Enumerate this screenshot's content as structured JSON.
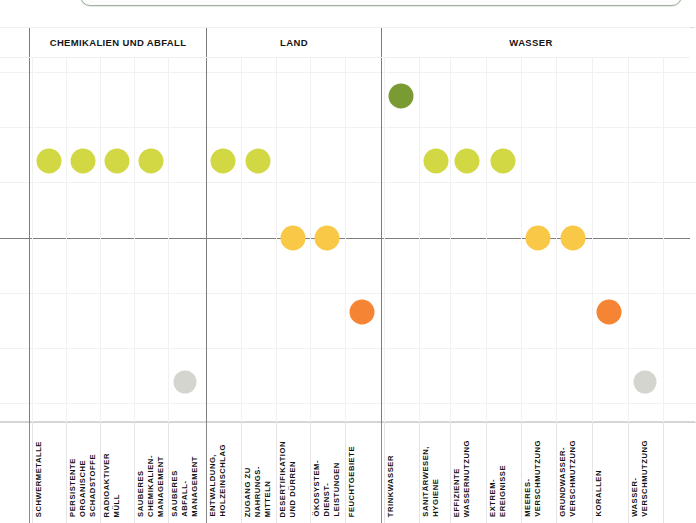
{
  "figure": {
    "title": "",
    "top_panel_edge": "rounded-panel-edge"
  },
  "groups": [
    {
      "id": "chemikalien",
      "label": "CHEMIKALIEN UND ABFALL",
      "x": 29,
      "width": 178
    },
    {
      "id": "land",
      "label": "LAND",
      "x": 207,
      "width": 174
    },
    {
      "id": "wasser",
      "label": "WASSER",
      "x": 381,
      "width": 300
    }
  ],
  "colors": {
    "dark_green": "#7a9b33",
    "yellow_green": "#d2d844",
    "yellow": "#f9c846",
    "orange": "#f58535",
    "grey": "#d4d5cf",
    "axis": "#7d7d7d",
    "grid": "#ececec",
    "panel_edge": "#9fb0a0"
  },
  "axis": {
    "zero_line_y": 211,
    "grid_rows_y": [
      45,
      100,
      155,
      211,
      266,
      321,
      376
    ],
    "plot_top": 30,
    "plot_bottom": 395
  },
  "columns": [
    {
      "id": "schwermetalle",
      "group": "chemikalien",
      "label": "SCHWERMETALLE",
      "x": 49,
      "dot": {
        "y": 134,
        "color": "yellow_green",
        "r": 12.5
      }
    },
    {
      "id": "persistente-organische",
      "group": "chemikalien",
      "label": "PERSISTENTE\nORGANISCHE\nSCHADSTOFFE",
      "x": 83,
      "dot": {
        "y": 134,
        "color": "yellow_green",
        "r": 12.5
      }
    },
    {
      "id": "radioaktiver-muell",
      "group": "chemikalien",
      "label": "RADIOAKTIVER\nMÜLL",
      "x": 117,
      "dot": {
        "y": 134,
        "color": "yellow_green",
        "r": 12.5
      }
    },
    {
      "id": "sauberes-chemikalien-management",
      "group": "chemikalien",
      "label": "SAUBERES\nCHEMIKALIEN-\nMANAGEMENT",
      "x": 151,
      "dot": {
        "y": 134,
        "color": "yellow_green",
        "r": 12.5
      }
    },
    {
      "id": "sauberes-abfall-management",
      "group": "chemikalien",
      "label": "SAUBERES\nABFALL-\nMANAGEMENT",
      "x": 185,
      "dot": {
        "y": 355,
        "color": "grey",
        "r": 11.5
      }
    },
    {
      "id": "entwaldung",
      "group": "land",
      "label": "ENTWALDUNG,\nHOLZEINSCHLAG",
      "x": 223,
      "dot": {
        "y": 134,
        "color": "yellow_green",
        "r": 12.5
      }
    },
    {
      "id": "zugang-nahrungsmittel",
      "group": "land",
      "label": "ZUGANG ZU\nNAHRUNGS-\nMITTELN",
      "x": 258,
      "dot": {
        "y": 134,
        "color": "yellow_green",
        "r": 12.5
      }
    },
    {
      "id": "desertifikation",
      "group": "land",
      "label": "DESERTIFIKATION\nUND DÜRREN",
      "x": 293,
      "dot": {
        "y": 211,
        "color": "yellow",
        "r": 12.5
      }
    },
    {
      "id": "oekosystem-dienstleistungen",
      "group": "land",
      "label": "ÖKOSYSTEM-\nDIENST-\nLEISTUNGEN",
      "x": 327,
      "dot": {
        "y": 211,
        "color": "yellow",
        "r": 12.5
      }
    },
    {
      "id": "feuchtgebiete",
      "group": "land",
      "label": "FEUCHTGEBIETE",
      "x": 362,
      "dot": {
        "y": 285,
        "color": "orange",
        "r": 12.5
      }
    },
    {
      "id": "trinkwasser",
      "group": "wasser",
      "label": "TRINKWASSER",
      "x": 401,
      "dot": {
        "y": 69,
        "color": "dark_green",
        "r": 12.5
      }
    },
    {
      "id": "sanitaerwesen-hygiene",
      "group": "wasser",
      "label": "SANITÄRWESEN,\nHYGIENE",
      "x": 436,
      "dot": {
        "y": 134,
        "color": "yellow_green",
        "r": 12.5
      }
    },
    {
      "id": "effiziente-wassernutzung",
      "group": "wasser",
      "label": "EFFIZIENTE\nWASSERNUTZUNG",
      "x": 467,
      "dot": {
        "y": 134,
        "color": "yellow_green",
        "r": 12.5
      }
    },
    {
      "id": "extremereignisse",
      "group": "wasser",
      "label": "EXTREM-\nEREIGNISSE",
      "x": 503,
      "dot": {
        "y": 134,
        "color": "yellow_green",
        "r": 12.5
      }
    },
    {
      "id": "meeresverschmutzung",
      "group": "wasser",
      "label": "MEERES-\nVERSCHMUTZUNG",
      "x": 538,
      "dot": {
        "y": 211,
        "color": "yellow",
        "r": 12.5
      }
    },
    {
      "id": "grundwasserverschmutzung",
      "group": "wasser",
      "label": "GRUNDWASSER-\nVERSCHMUTZUNG",
      "x": 573,
      "dot": {
        "y": 211,
        "color": "yellow",
        "r": 12.5
      }
    },
    {
      "id": "korallen",
      "group": "wasser",
      "label": "KORALLEN",
      "x": 609,
      "dot": {
        "y": 285,
        "color": "orange",
        "r": 12.5
      }
    },
    {
      "id": "wasserverschmutzung",
      "group": "wasser",
      "label": "WASSER-\nVERSCHMUTZUNG",
      "x": 645,
      "dot": {
        "y": 355,
        "color": "grey",
        "r": 11.5
      }
    }
  ],
  "chart_data": {
    "type": "scatter",
    "title": "",
    "subtitle": "",
    "xlabel": "",
    "ylabel": "",
    "grid": true,
    "legend_position": "none",
    "groups": [
      "CHEMIKALIEN UND ABFALL",
      "LAND",
      "WASSER"
    ],
    "categories": [
      "SCHWERMETALLE",
      "PERSISTENTE ORGANISCHE SCHADSTOFFE",
      "RADIOAKTIVER MÜLL",
      "SAUBERES CHEMIKALIEN-MANAGEMENT",
      "SAUBERES ABFALL-MANAGEMENT",
      "ENTWALDUNG, HOLZEINSCHLAG",
      "ZUGANG ZU NAHRUNGSMITTELN",
      "DESERTIFIKATION UND DÜRREN",
      "ÖKOSYSTEM-DIENSTLEISTUNGEN",
      "FEUCHTGEBIETE",
      "TRINKWASSER",
      "SANITÄRWESEN, HYGIENE",
      "EFFIZIENTE WASSERNUTZUNG",
      "EXTREMEREIGNISSE",
      "MEERESVERSCHMUTZUNG",
      "GRUNDWASSERVERSCHMUTZUNG",
      "KORALLEN",
      "WASSERVERSCHMUTZUNG"
    ],
    "values": [
      1,
      1,
      1,
      1,
      -3,
      1,
      1,
      0,
      0,
      -1,
      2,
      1,
      1,
      1,
      0,
      0,
      -1,
      -3
    ],
    "value_colors": [
      "yellow_green",
      "yellow_green",
      "yellow_green",
      "yellow_green",
      "grey",
      "yellow_green",
      "yellow_green",
      "yellow",
      "yellow",
      "orange",
      "dark_green",
      "yellow_green",
      "yellow_green",
      "yellow_green",
      "yellow",
      "yellow",
      "orange",
      "grey"
    ],
    "ylim": [
      -3.5,
      2.5
    ],
    "yticks": [
      2,
      1,
      0,
      -1,
      -2,
      -3
    ]
  }
}
